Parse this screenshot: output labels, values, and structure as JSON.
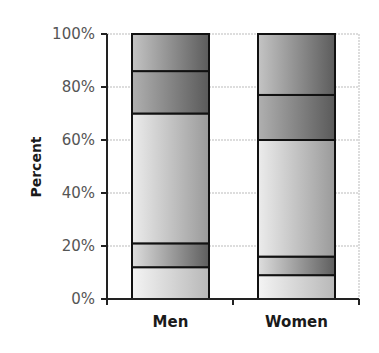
{
  "chart_data": {
    "type": "bar",
    "stacked": true,
    "percent": true,
    "title": "",
    "xlabel": "",
    "ylabel": "Percent",
    "ylim": [
      0,
      100
    ],
    "yticks": [
      "0%",
      "20%",
      "40%",
      "60%",
      "80%",
      "100%"
    ],
    "categories": [
      "Men",
      "Women"
    ],
    "series": [
      {
        "name": "Segment 1 (bottom)",
        "values": [
          12,
          9
        ]
      },
      {
        "name": "Segment 2",
        "values": [
          9,
          7
        ]
      },
      {
        "name": "Segment 3",
        "values": [
          49,
          44
        ]
      },
      {
        "name": "Segment 4",
        "values": [
          16,
          17
        ]
      },
      {
        "name": "Segment 5 (top)",
        "values": [
          14,
          23
        ]
      }
    ],
    "grid": true,
    "legend": "none",
    "colors": {
      "bar_outline": "#111111",
      "gridline": "#bbbbbb",
      "axis": "#222222",
      "fill_light": "#f2f2f2",
      "fill_dark": "#6e6e6e"
    }
  }
}
